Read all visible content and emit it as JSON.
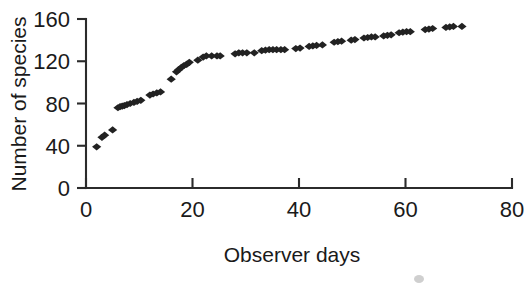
{
  "figure": {
    "background_color": "#ffffff",
    "ink_color": "#222222",
    "axis_color": "#2b2b2b"
  },
  "chart_data": {
    "type": "scatter",
    "title": "",
    "xlabel": "Observer days",
    "ylabel": "Number of species",
    "xlim": [
      0,
      80
    ],
    "ylim": [
      0,
      160
    ],
    "xticks": [
      0,
      20,
      40,
      60,
      80
    ],
    "yticks": [
      0,
      40,
      80,
      120,
      160
    ],
    "xtick_labels": [
      "0",
      "20",
      "40",
      "60",
      "80"
    ],
    "ytick_labels": [
      "0",
      "40",
      "80",
      "120",
      "160"
    ],
    "grid": false,
    "legend": null,
    "marker": "diamond",
    "marker_color": "#222222",
    "series": [
      {
        "name": "Species accumulation",
        "x": [
          2,
          3,
          3.5,
          5,
          6,
          6.4,
          6.8,
          7.2,
          7.7,
          8.3,
          9,
          9.6,
          10.3,
          12,
          12.6,
          13.3,
          14,
          16,
          17,
          17.4,
          17.9,
          18.4,
          18.9,
          19.4,
          21,
          22,
          22.6,
          23.6,
          24.6,
          25.2,
          28,
          28.7,
          29.4,
          30.2,
          31.6,
          33,
          33.7,
          34.4,
          35.1,
          35.8,
          36.6,
          37.3,
          39.4,
          40.2,
          41.9,
          42.6,
          43.3,
          44.4,
          46.6,
          47.3,
          48,
          49.8,
          50.5,
          52.2,
          52.9,
          53.6,
          54.3,
          55.9,
          56.6,
          57.3,
          58.8,
          59.5,
          60.2,
          60.9,
          63.7,
          64.4,
          65.1,
          67.6,
          68.3,
          69,
          70.6
        ],
        "y": [
          39,
          48,
          50,
          55,
          76,
          77,
          77.5,
          78,
          79,
          80,
          81,
          82,
          83,
          88,
          89,
          90,
          91,
          103,
          110,
          112,
          114,
          116,
          117,
          119,
          121,
          124,
          125,
          125,
          125,
          125,
          127,
          128,
          128,
          128,
          128,
          130,
          130.5,
          131,
          131,
          131,
          131,
          131,
          132,
          132.5,
          134,
          134.5,
          135,
          135.5,
          138,
          138.5,
          139,
          140,
          140.5,
          142,
          142.5,
          143,
          143,
          144,
          144.5,
          145,
          147,
          147.5,
          148,
          148,
          150,
          150.5,
          151,
          152,
          152.5,
          153,
          153
        ]
      }
    ]
  },
  "axis_labels": {
    "x_title": "Observer days",
    "y_title": "Number of species"
  }
}
